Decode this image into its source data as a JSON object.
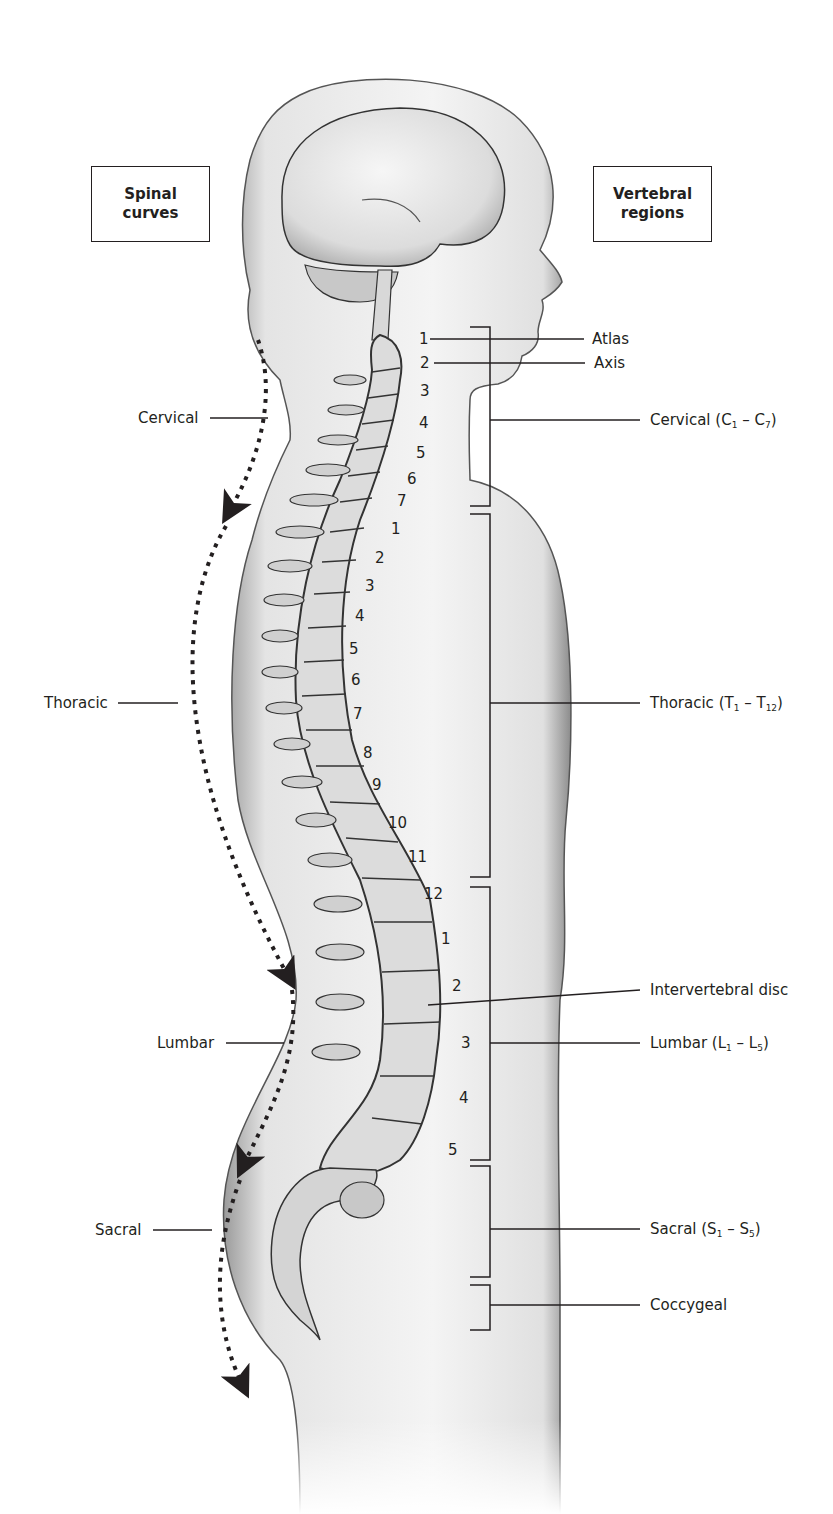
{
  "headers": {
    "left": [
      "Spinal",
      "curves"
    ],
    "right": [
      "Vertebral",
      "regions"
    ]
  },
  "spinal_curves": [
    {
      "label": "Cervical"
    },
    {
      "label": "Thoracic"
    },
    {
      "label": "Lumbar"
    },
    {
      "label": "Sacral"
    }
  ],
  "vertebral_regions": {
    "atlas": "Atlas",
    "axis": "Axis",
    "cervical": {
      "name": "Cervical (",
      "a": "C",
      "a_sub": "1",
      "dash": " – ",
      "b": "C",
      "b_sub": "7",
      "close": ")"
    },
    "thoracic": {
      "name": "Thoracic (",
      "a": "T",
      "a_sub": "1",
      "dash": " – ",
      "b": "T",
      "b_sub": "12",
      "close": ")"
    },
    "intervertebral_disc": "Intervertebral disc",
    "lumbar": {
      "name": "Lumbar (",
      "a": "L",
      "a_sub": "1",
      "dash": " – ",
      "b": "L",
      "b_sub": "5",
      "close": ")"
    },
    "sacral": {
      "name": "Sacral (",
      "a": "S",
      "a_sub": "1",
      "dash": " – ",
      "b": "S",
      "b_sub": "5",
      "close": ")"
    },
    "coccygeal": "Coccygeal"
  },
  "vertebra_numbers": {
    "cervical": [
      "1",
      "2",
      "3",
      "4",
      "5",
      "6",
      "7"
    ],
    "thoracic": [
      "1",
      "2",
      "3",
      "4",
      "5",
      "6",
      "7",
      "8",
      "9",
      "10",
      "11",
      "12"
    ],
    "lumbar": [
      "1",
      "2",
      "3",
      "4",
      "5"
    ]
  },
  "colors": {
    "ink": "#231f20",
    "skin": "#ececec",
    "bone": "#d9d9d9"
  }
}
